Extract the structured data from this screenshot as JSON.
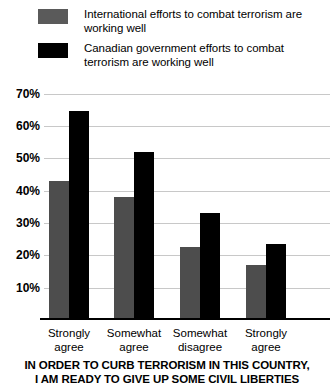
{
  "legend": {
    "items": [
      {
        "swatch": "gray",
        "color": "#5a5a5a",
        "label": "International efforts to combat terrorism are working well"
      },
      {
        "swatch": "black",
        "color": "#000000",
        "label": "Canadian government efforts to combat terrorism are working well"
      }
    ]
  },
  "axis": {
    "yticks": [
      "10%",
      "20%",
      "30%",
      "40%",
      "50%",
      "60%",
      "70%"
    ]
  },
  "categories": [
    {
      "line1": "Strongly",
      "line2": "agree"
    },
    {
      "line1": "Somewhat",
      "line2": "agree"
    },
    {
      "line1": "Somewhat",
      "line2": "disagree"
    },
    {
      "line1": "Strongly",
      "line2": "agree"
    }
  ],
  "title": {
    "line1": "IN ORDER TO CURB TERRORISM IN THIS COUNTRY,",
    "line2": "I AM READY TO GIVE UP SOME CIVIL LIBERTIES"
  },
  "chart_data": {
    "type": "bar",
    "title": "IN ORDER TO CURB TERRORISM IN THIS COUNTRY, I AM READY TO GIVE UP SOME CIVIL LIBERTIES",
    "xlabel": "",
    "ylabel": "",
    "categories": [
      "Strongly agree",
      "Somewhat agree",
      "Somewhat disagree",
      "Strongly agree"
    ],
    "series": [
      {
        "name": "International efforts to combat terrorism are working well",
        "color": "#4d4d4d",
        "values": [
          43,
          38,
          22.5,
          17
        ]
      },
      {
        "name": "Canadian government efforts to combat terrorism are working well",
        "color": "#000000",
        "values": [
          64.5,
          52,
          33,
          23.5
        ]
      }
    ],
    "ylim": [
      0,
      73
    ],
    "ytick_values": [
      10,
      20,
      30,
      40,
      50,
      60,
      70
    ],
    "grid": true,
    "legend_position": "top"
  }
}
